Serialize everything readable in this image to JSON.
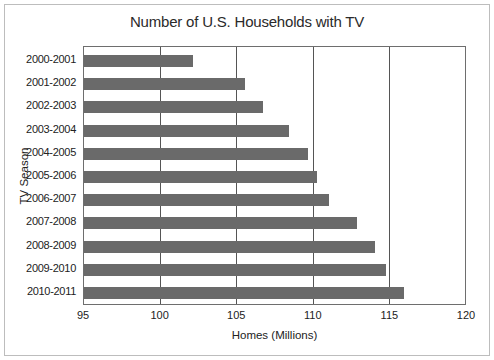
{
  "chart_data": {
    "type": "bar",
    "orientation": "horizontal",
    "title": "Number of U.S. Households with TV",
    "xlabel": "Homes (Millions)",
    "ylabel": "TV Season",
    "xlim": [
      95,
      120
    ],
    "xticks": [
      "95",
      "100",
      "105",
      "110",
      "115",
      "120"
    ],
    "grid": "vertical",
    "legend": null,
    "categories": [
      "2000-2001",
      "2001-2002",
      "2002-2003",
      "2003-2004",
      "2004-2005",
      "2005-2006",
      "2006-2007",
      "2007-2008",
      "2008-2009",
      "2009-2010",
      "2010-2011"
    ],
    "values": [
      102.1,
      105.5,
      106.7,
      108.4,
      109.6,
      110.2,
      111.0,
      112.8,
      114.0,
      114.7,
      115.9
    ],
    "bar_color": "#6a6a6a"
  }
}
